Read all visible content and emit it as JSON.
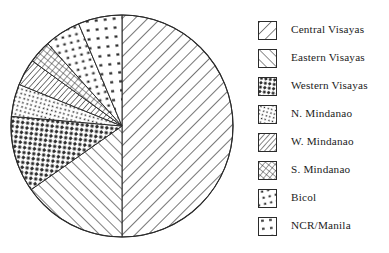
{
  "chart_data": {
    "type": "pie",
    "title": "",
    "legend_position": "right",
    "grid": false,
    "center": {
      "x": 122,
      "y": 126
    },
    "radius": 111,
    "start_angle_deg": 0,
    "direction": "clockwise",
    "categories": [
      "Central Visayas",
      "Eastern Visayas",
      "Western Visayas",
      "N. Mindanao",
      "W. Mindanao",
      "S. Mindanao",
      "Bicol",
      "NCR/Manila"
    ],
    "values": [
      50,
      15.3,
      11.1,
      4.7,
      3.9,
      3.3,
      5.3,
      6.4
    ],
    "slices": [
      {
        "label": "Central Visayas",
        "value": 50,
        "start_deg": 0,
        "end_deg": 180.0,
        "pattern": "diagonal-hatch-right"
      },
      {
        "label": "Eastern Visayas",
        "value": 15.3,
        "start_deg": 180.0,
        "end_deg": 235.0,
        "pattern": "diagonal-hatch-left"
      },
      {
        "label": "Western Visayas",
        "value": 11.1,
        "start_deg": 235.0,
        "end_deg": 275.0,
        "pattern": "coarse-dots"
      },
      {
        "label": "N. Mindanao",
        "value": 4.7,
        "start_deg": 275.0,
        "end_deg": 292.0,
        "pattern": "fine-dots"
      },
      {
        "label": "W. Mindanao",
        "value": 3.9,
        "start_deg": 292.0,
        "end_deg": 306.0,
        "pattern": "dense-hatch"
      },
      {
        "label": "S. Mindanao",
        "value": 3.3,
        "start_deg": 306.0,
        "end_deg": 318.0,
        "pattern": "cross-hatch"
      },
      {
        "label": "Bicol",
        "value": 5.3,
        "start_deg": 318.0,
        "end_deg": 337.0,
        "pattern": "grid-dots"
      },
      {
        "label": "NCR/Manila",
        "value": 6.4,
        "start_deg": 337.0,
        "end_deg": 360.0,
        "pattern": "sparse-dots"
      }
    ],
    "xlabel": "",
    "ylabel": ""
  },
  "legend": {
    "items": [
      {
        "label": "Central Visayas",
        "pattern": "diagonal-hatch-right"
      },
      {
        "label": "Eastern Visayas",
        "pattern": "diagonal-hatch-left"
      },
      {
        "label": "Western Visayas",
        "pattern": "coarse-dots"
      },
      {
        "label": "N. Mindanao",
        "pattern": "fine-dots"
      },
      {
        "label": "W. Mindanao",
        "pattern": "dense-hatch"
      },
      {
        "label": "S. Mindanao",
        "pattern": "cross-hatch"
      },
      {
        "label": "Bicol",
        "pattern": "grid-dots"
      },
      {
        "label": "NCR/Manila",
        "pattern": "sparse-dots"
      }
    ]
  },
  "colors": {
    "ink": "#2b2b2b",
    "background": "#ffffff"
  }
}
